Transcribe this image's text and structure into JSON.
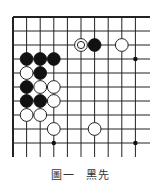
{
  "diagram": {
    "type": "go-board-fragment",
    "grid": {
      "origin_x": 13,
      "origin_y": 17,
      "spacing_x": 13.6,
      "spacing_y": 14,
      "cols": 10,
      "rows": 10,
      "line_extend_right": 150,
      "line_extend_bottom": 157,
      "top_edge": "border",
      "left_edge": "border",
      "line_color": "#222222"
    },
    "star_points": [
      {
        "col": 9,
        "row": 3
      },
      {
        "col": 3,
        "row": 9
      },
      {
        "col": 9,
        "row": 9
      }
    ],
    "stones": [
      {
        "col": 5,
        "row": 2,
        "color": "white",
        "marked": true
      },
      {
        "col": 6,
        "row": 2,
        "color": "black"
      },
      {
        "col": 8,
        "row": 2,
        "color": "white"
      },
      {
        "col": 1,
        "row": 3,
        "color": "black"
      },
      {
        "col": 2,
        "row": 3,
        "color": "black"
      },
      {
        "col": 3,
        "row": 3,
        "color": "black"
      },
      {
        "col": 1,
        "row": 4,
        "color": "white"
      },
      {
        "col": 2,
        "row": 4,
        "color": "black"
      },
      {
        "col": 1,
        "row": 5,
        "color": "black"
      },
      {
        "col": 2,
        "row": 5,
        "color": "white"
      },
      {
        "col": 3,
        "row": 5,
        "color": "white"
      },
      {
        "col": 1,
        "row": 6,
        "color": "black"
      },
      {
        "col": 2,
        "row": 6,
        "color": "black"
      },
      {
        "col": 3,
        "row": 6,
        "color": "white"
      },
      {
        "col": 1,
        "row": 7,
        "color": "white"
      },
      {
        "col": 2,
        "row": 7,
        "color": "white"
      },
      {
        "col": 3,
        "row": 8,
        "color": "white"
      },
      {
        "col": 6,
        "row": 8,
        "color": "white"
      }
    ]
  },
  "caption": {
    "figure": "圖一",
    "instruction": "黑先"
  }
}
